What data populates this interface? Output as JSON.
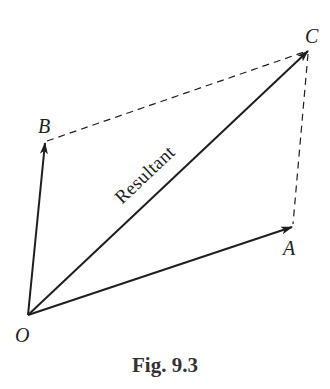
{
  "figure": {
    "caption": "Fig. 9.3",
    "resultant_label": "Resultant",
    "colors": {
      "stroke": "#1e1e1e",
      "caption": "#333333",
      "background": "#ffffff"
    },
    "points": {
      "O": {
        "label": "O",
        "x": 28,
        "y": 315
      },
      "A": {
        "label": "A",
        "x": 293,
        "y": 226
      },
      "B": {
        "label": "B",
        "x": 45,
        "y": 142
      },
      "C": {
        "label": "C",
        "x": 309,
        "y": 50
      }
    },
    "vectors": [
      {
        "name": "OA",
        "from": "O",
        "to": "A",
        "style": "solid-arrow"
      },
      {
        "name": "OB",
        "from": "O",
        "to": "B",
        "style": "solid-arrow"
      },
      {
        "name": "OC",
        "from": "O",
        "to": "C",
        "style": "solid-arrow",
        "label": "Resultant"
      }
    ],
    "construction_lines": [
      {
        "name": "BC",
        "from": "B",
        "to": "C",
        "style": "dashed"
      },
      {
        "name": "AC",
        "from": "A",
        "to": "C",
        "style": "dashed"
      }
    ]
  }
}
